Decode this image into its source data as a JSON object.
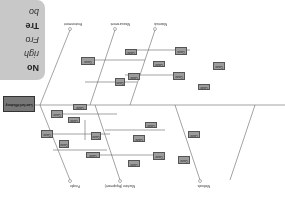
{
  "diagram": {
    "type": "fishbone",
    "orientation": "rotated-180",
    "head": "Low fuel efficiency",
    "categories_top": [
      "People",
      "Machine (Equipment)",
      "Methods"
    ],
    "categories_bottom": [
      "Materials",
      "Measurement",
      "Environment"
    ],
    "colors": {
      "box": "#9c9c9c",
      "border": "#555555",
      "line": "#666666",
      "card": "#c8c8c8"
    }
  },
  "boxes": [
    "Cause",
    "Cause",
    "Cause",
    "Cause",
    "Cause",
    "Cause",
    "Cause",
    "Cause",
    "Cause",
    "Cause",
    "Cause",
    "Cause",
    "Cause",
    "Cause",
    "Cause",
    "Cause",
    "Cause",
    "Cause",
    "Cause",
    "Cause",
    "Cause",
    "Cause"
  ],
  "card": {
    "lines": [
      "No",
      "righ",
      "Fro",
      "Tre",
      "bo"
    ]
  }
}
